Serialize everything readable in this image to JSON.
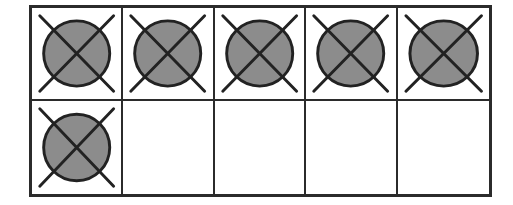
{
  "ten_frame": {
    "rows": 2,
    "columns": 5,
    "total_cells": 10,
    "filled_count": 6,
    "empty_count": 4,
    "marker": "crossed-out-circle",
    "colors": {
      "border": "#2b2b2b",
      "circle_fill": "#8c8c8c",
      "circle_stroke": "#222222",
      "cross_stroke": "#222222",
      "background": "#ffffff"
    },
    "cells": [
      {
        "row": 1,
        "col": 1,
        "filled": true,
        "crossed": true
      },
      {
        "row": 1,
        "col": 2,
        "filled": true,
        "crossed": true
      },
      {
        "row": 1,
        "col": 3,
        "filled": true,
        "crossed": true
      },
      {
        "row": 1,
        "col": 4,
        "filled": true,
        "crossed": true
      },
      {
        "row": 1,
        "col": 5,
        "filled": true,
        "crossed": true
      },
      {
        "row": 2,
        "col": 1,
        "filled": true,
        "crossed": true
      },
      {
        "row": 2,
        "col": 2,
        "filled": false,
        "crossed": false
      },
      {
        "row": 2,
        "col": 3,
        "filled": false,
        "crossed": false
      },
      {
        "row": 2,
        "col": 4,
        "filled": false,
        "crossed": false
      },
      {
        "row": 2,
        "col": 5,
        "filled": false,
        "crossed": false
      }
    ]
  }
}
